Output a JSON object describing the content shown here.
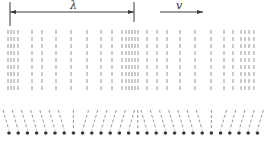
{
  "diagram": {
    "type": "longitudinal-wave",
    "wavelength_label": "λ",
    "velocity_label": "v",
    "colors": {
      "ink": "#3a3a3a",
      "dash": "#8a8a8a",
      "background": "#ffffff"
    },
    "wavelength_marker": {
      "x_start": 10,
      "x_end": 134,
      "y": 12
    },
    "velocity_arrow": {
      "x_start": 160,
      "x_end": 203,
      "y": 12
    },
    "column_lines_x": [
      8,
      11,
      14,
      18,
      32,
      42,
      56,
      71,
      87,
      101,
      112,
      122,
      126,
      129,
      132,
      135,
      138,
      147,
      157,
      167,
      180,
      195,
      211,
      224,
      233,
      241,
      245,
      249,
      254
    ],
    "particles": {
      "count": 28,
      "x_start": 9,
      "spacing": 9.2,
      "y": 133,
      "displacement_pattern": [
        -1,
        -1,
        -1,
        -1,
        -1,
        -1,
        -1,
        0,
        1,
        1,
        1,
        1,
        1,
        1,
        0,
        -1,
        -1,
        -1,
        -1,
        -1,
        -1,
        -1,
        0,
        1,
        1,
        1,
        1,
        1
      ]
    }
  }
}
